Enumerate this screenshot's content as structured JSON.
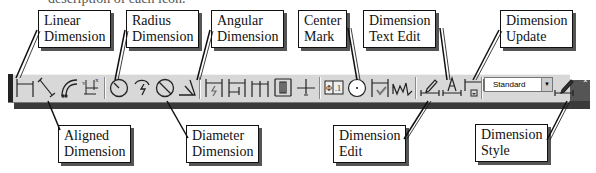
{
  "caption_fragment": "description of each icon.",
  "toolbar": {
    "name": "Dimension toolbar",
    "buttons": [
      {
        "id": "linear",
        "icon": "linear-dimension-icon"
      },
      {
        "id": "aligned",
        "icon": "aligned-dimension-icon"
      },
      {
        "id": "arc-length",
        "icon": "arc-length-icon"
      },
      {
        "id": "ordinate",
        "icon": "ordinate-dimension-icon"
      },
      {
        "id": "radius",
        "icon": "radius-dimension-icon"
      },
      {
        "id": "jogged",
        "icon": "jogged-dimension-icon"
      },
      {
        "id": "diameter",
        "icon": "diameter-dimension-icon"
      },
      {
        "id": "angular",
        "icon": "angular-dimension-icon"
      },
      {
        "id": "quick-dimension",
        "icon": "quick-dimension-icon"
      },
      {
        "id": "baseline",
        "icon": "baseline-dimension-icon"
      },
      {
        "id": "continue",
        "icon": "continue-dimension-icon"
      },
      {
        "id": "dimension-space",
        "icon": "dimension-space-icon"
      },
      {
        "id": "dimension-break",
        "icon": "dimension-break-icon"
      },
      {
        "id": "tolerance",
        "icon": "tolerance-icon"
      },
      {
        "id": "center-mark",
        "icon": "center-mark-icon"
      },
      {
        "id": "inspection",
        "icon": "inspection-icon"
      },
      {
        "id": "jogged-linear",
        "icon": "jogged-linear-icon"
      },
      {
        "id": "dimension-edit",
        "icon": "dimension-edit-icon"
      },
      {
        "id": "dimension-text-edit",
        "icon": "dimension-text-edit-icon"
      },
      {
        "id": "dimension-update",
        "icon": "dimension-update-icon"
      },
      {
        "id": "dimension-style",
        "icon": "dimension-style-icon"
      }
    ],
    "style_dropdown": {
      "value": "Standard",
      "arrow": "▼"
    },
    "close": "×"
  },
  "callouts": {
    "linear": {
      "line1": "Linear",
      "line2": "Dimension"
    },
    "radius": {
      "line1": "Radius",
      "line2": "Dimension"
    },
    "angular": {
      "line1": "Angular",
      "line2": "Dimension"
    },
    "center": {
      "line1": "Center",
      "line2": "Mark"
    },
    "textedit": {
      "line1": "Dimension",
      "line2": "Text Edit"
    },
    "update": {
      "line1": "Dimension",
      "line2": "Update"
    },
    "aligned": {
      "line1": "Aligned",
      "line2": "Dimension"
    },
    "diameter": {
      "line1": "Diameter",
      "line2": "Dimension"
    },
    "edit": {
      "line1": "Dimension",
      "line2": "Edit"
    },
    "style": {
      "line1": "Dimension",
      "line2": "Style"
    }
  }
}
